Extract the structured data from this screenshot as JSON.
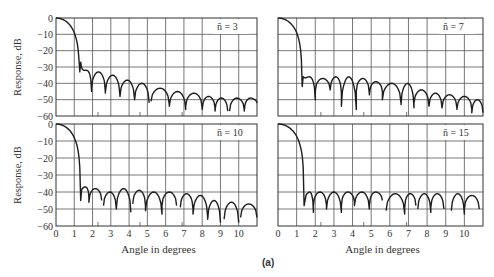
{
  "figure": {
    "caption": "(a)"
  },
  "chart_data": [
    {
      "type": "line",
      "panel": "top-left",
      "annotation": "n̄ = 3",
      "n_bar": 3,
      "xlabel": "",
      "ylabel": "Response, dB",
      "xlim": [
        0,
        11
      ],
      "ylim": [
        -60,
        0
      ],
      "yticks": [
        0,
        -10,
        -20,
        -30,
        -40,
        -50,
        -60
      ],
      "grid": true,
      "main_lobe_first_null": 1.3,
      "mainlobe_floor": -33,
      "sidelobes": [
        {
          "start": 1.35,
          "end": 1.95,
          "peak": -32,
          "end_level": -45
        },
        {
          "start": 1.95,
          "end": 2.7,
          "peak": -33,
          "end_level": -45
        },
        {
          "start": 2.7,
          "end": 3.5,
          "peak": -35,
          "end_level": -48
        },
        {
          "start": 3.5,
          "end": 4.3,
          "peak": -38,
          "end_level": -50
        },
        {
          "start": 4.3,
          "end": 5.1,
          "peak": -40,
          "end_level": -52
        },
        {
          "start": 5.2,
          "end": 6.2,
          "peak": -43,
          "end_level": -53
        },
        {
          "start": 6.2,
          "end": 7.1,
          "peak": -45,
          "end_level": -56
        },
        {
          "start": 7.1,
          "end": 8.0,
          "peak": -46,
          "end_level": -55
        },
        {
          "start": 8.0,
          "end": 8.7,
          "peak": -48,
          "end_level": -55
        },
        {
          "start": 8.7,
          "end": 9.4,
          "peak": -49,
          "end_level": -57
        },
        {
          "start": 9.5,
          "end": 10.3,
          "peak": -49,
          "end_level": -56
        },
        {
          "start": 10.3,
          "end": 11.0,
          "peak": -49,
          "end_level": -52
        }
      ]
    },
    {
      "type": "line",
      "panel": "top-right",
      "annotation": "n̄ = 7",
      "n_bar": 7,
      "xlabel": "",
      "ylabel": "",
      "xlim": [
        0,
        11
      ],
      "ylim": [
        -60,
        0
      ],
      "grid": true,
      "main_lobe_first_null": 1.3,
      "mainlobe_floor": -42,
      "sidelobes": [
        {
          "start": 1.35,
          "end": 2.0,
          "peak": -36,
          "end_level": -50
        },
        {
          "start": 2.0,
          "end": 2.8,
          "peak": -37,
          "end_level": -44
        },
        {
          "start": 2.8,
          "end": 3.4,
          "peak": -36,
          "end_level": -46
        },
        {
          "start": 3.4,
          "end": 4.2,
          "peak": -36,
          "end_level": -56
        },
        {
          "start": 4.2,
          "end": 4.9,
          "peak": -37,
          "end_level": -46
        },
        {
          "start": 4.9,
          "end": 5.6,
          "peak": -39,
          "end_level": -45
        },
        {
          "start": 5.6,
          "end": 6.6,
          "peak": -40,
          "end_level": -52
        },
        {
          "start": 6.6,
          "end": 7.3,
          "peak": -40,
          "end_level": -55
        },
        {
          "start": 7.3,
          "end": 8.1,
          "peak": -44,
          "end_level": -54
        },
        {
          "start": 8.1,
          "end": 8.8,
          "peak": -46,
          "end_level": -55
        },
        {
          "start": 8.8,
          "end": 9.6,
          "peak": -47,
          "end_level": -55
        },
        {
          "start": 9.6,
          "end": 10.4,
          "peak": -48,
          "end_level": -56
        },
        {
          "start": 10.4,
          "end": 11.0,
          "peak": -50,
          "end_level": -58
        }
      ]
    },
    {
      "type": "line",
      "panel": "bottom-left",
      "annotation": "n̄ = 10",
      "n_bar": 10,
      "xlabel": "Angle in degrees",
      "ylabel": "Response, dB",
      "xlim": [
        0,
        11
      ],
      "ylim": [
        -60,
        0
      ],
      "xticks": [
        0,
        1,
        2,
        3,
        4,
        5,
        6,
        7,
        8,
        9,
        10
      ],
      "yticks": [
        0,
        -10,
        -20,
        -30,
        -40,
        -50,
        -60
      ],
      "grid": true,
      "main_lobe_first_null": 1.35,
      "mainlobe_floor": -45,
      "sidelobes": [
        {
          "start": 1.4,
          "end": 1.8,
          "peak": -37,
          "end_level": -43
        },
        {
          "start": 1.8,
          "end": 2.5,
          "peak": -38,
          "end_level": -45
        },
        {
          "start": 2.6,
          "end": 3.3,
          "peak": -40,
          "end_level": -50
        },
        {
          "start": 3.3,
          "end": 4.1,
          "peak": -38,
          "end_level": -52
        },
        {
          "start": 4.2,
          "end": 4.9,
          "peak": -39,
          "end_level": -48
        },
        {
          "start": 4.9,
          "end": 5.8,
          "peak": -40,
          "end_level": -53
        },
        {
          "start": 5.8,
          "end": 6.6,
          "peak": -40,
          "end_level": -48
        },
        {
          "start": 6.8,
          "end": 7.5,
          "peak": -41,
          "end_level": -50
        },
        {
          "start": 7.5,
          "end": 8.3,
          "peak": -42,
          "end_level": -55
        },
        {
          "start": 8.3,
          "end": 9.0,
          "peak": -45,
          "end_level": -58
        },
        {
          "start": 9.2,
          "end": 10.0,
          "peak": -46,
          "end_level": -58
        },
        {
          "start": 10.1,
          "end": 11.0,
          "peak": -47,
          "end_level": -55
        }
      ]
    },
    {
      "type": "line",
      "panel": "bottom-right",
      "annotation": "n̄ = 15",
      "n_bar": 15,
      "xlabel": "Angle in degrees",
      "ylabel": "",
      "xlim": [
        0,
        11
      ],
      "ylim": [
        -60,
        0
      ],
      "xticks": [
        0,
        1,
        2,
        3,
        4,
        5,
        6,
        7,
        8,
        9,
        10
      ],
      "grid": true,
      "main_lobe_first_null": 1.4,
      "mainlobe_floor": -48,
      "sidelobes": [
        {
          "start": 1.5,
          "end": 1.9,
          "peak": -40,
          "end_level": -52
        },
        {
          "start": 1.9,
          "end": 2.6,
          "peak": -40,
          "end_level": -48
        },
        {
          "start": 2.6,
          "end": 3.4,
          "peak": -40,
          "end_level": -52
        },
        {
          "start": 3.4,
          "end": 4.1,
          "peak": -40,
          "end_level": -46
        },
        {
          "start": 4.1,
          "end": 4.9,
          "peak": -40,
          "end_level": -50
        },
        {
          "start": 4.9,
          "end": 5.6,
          "peak": -40,
          "end_level": -45
        },
        {
          "start": 5.8,
          "end": 6.8,
          "peak": -41,
          "end_level": -53
        },
        {
          "start": 6.8,
          "end": 7.4,
          "peak": -41,
          "end_level": -48
        },
        {
          "start": 7.5,
          "end": 8.2,
          "peak": -41,
          "end_level": -52
        },
        {
          "start": 8.2,
          "end": 8.9,
          "peak": -41,
          "end_level": -50
        },
        {
          "start": 9.3,
          "end": 10.0,
          "peak": -41,
          "end_level": -53
        },
        {
          "start": 10.0,
          "end": 10.8,
          "peak": -42,
          "end_level": -50
        }
      ]
    }
  ],
  "layout": {
    "panels": [
      {
        "x0": 56,
        "x1": 257,
        "y0": 18,
        "y1": 116
      },
      {
        "x0": 278,
        "x1": 483,
        "y0": 18,
        "y1": 116
      },
      {
        "x0": 56,
        "x1": 257,
        "y0": 124,
        "y1": 226
      },
      {
        "x0": 278,
        "x1": 483,
        "y0": 124,
        "y1": 226
      }
    ]
  }
}
